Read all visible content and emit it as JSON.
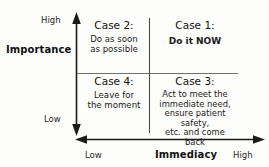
{
  "diagram": {
    "type": "2x2 priority matrix",
    "y_axis": {
      "name": "Importance",
      "high_label": "High",
      "low_label": "Low"
    },
    "x_axis": {
      "name": "Immediacy",
      "high_label": "High",
      "low_label": "Low"
    },
    "quadrants": {
      "case2": {
        "title": "Case 2:",
        "line1": "Do as soon",
        "line2": "as possible"
      },
      "case1": {
        "title": "Case 1:",
        "line1": "Do it NOW"
      },
      "case4": {
        "title": "Case 4:",
        "line1": "Leave for",
        "line2": "the moment"
      },
      "case3": {
        "title": "Case 3:",
        "line1": "Act to meet the",
        "line2": "immediate need,",
        "line3": "ensure patient safety,",
        "line4": "etc. and come back"
      }
    },
    "colors": {
      "axis": "#1a1a1a",
      "divider": "#6f6f6f",
      "background": "#fdfdfb",
      "text": "#1a1a1a"
    }
  }
}
